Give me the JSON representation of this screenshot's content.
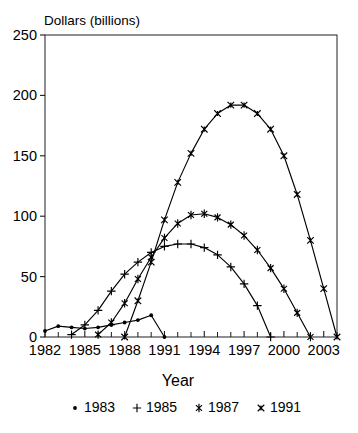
{
  "chart_data": {
    "type": "line",
    "title": "",
    "xlabel": "Year",
    "ylabel": "Dollars (billions)",
    "xlim": [
      1982,
      2004
    ],
    "ylim": [
      0,
      250
    ],
    "yticks": [
      0,
      50,
      100,
      150,
      200,
      250
    ],
    "ytick_labels": [
      "0",
      "50",
      "100",
      "150",
      "200",
      "250"
    ],
    "xticks": [
      1982,
      1985,
      1988,
      1991,
      1994,
      1997,
      2000,
      2003
    ],
    "xtick_labels": [
      "1982",
      "1985",
      "1988",
      "1991",
      "1994",
      "1997",
      "2000",
      "2003"
    ],
    "x_minor_tick_interval": 1,
    "grid": "horizontal-dotted",
    "legend_position": "below",
    "series": [
      {
        "name": "1983",
        "marker": "dot",
        "x": [
          1982,
          1983,
          1984,
          1985,
          1986,
          1987,
          1988,
          1989,
          1990,
          1991
        ],
        "values": [
          5,
          9,
          8,
          7,
          8,
          10,
          12,
          14,
          18,
          0
        ]
      },
      {
        "name": "1985",
        "marker": "plus",
        "x": [
          1984,
          1985,
          1986,
          1987,
          1988,
          1989,
          1990,
          1991,
          1992,
          1993,
          1994,
          1995,
          1996,
          1997,
          1998,
          1999
        ],
        "values": [
          2,
          10,
          22,
          38,
          52,
          62,
          70,
          75,
          77,
          77,
          74,
          68,
          58,
          44,
          26,
          0
        ]
      },
      {
        "name": "1987",
        "marker": "asterisk",
        "x": [
          1986,
          1987,
          1988,
          1989,
          1990,
          1991,
          1992,
          1993,
          1994,
          1995,
          1996,
          1997,
          1998,
          1999,
          2000,
          2001,
          2002
        ],
        "values": [
          2,
          12,
          28,
          48,
          66,
          82,
          94,
          101,
          102,
          99,
          93,
          84,
          72,
          57,
          40,
          20,
          0
        ]
      },
      {
        "name": "1991",
        "marker": "star-x",
        "x": [
          1988,
          1989,
          1990,
          1991,
          1992,
          1993,
          1994,
          1995,
          1996,
          1997,
          1998,
          1999,
          2000,
          2001,
          2002,
          2003,
          2004
        ],
        "values": [
          0,
          30,
          62,
          97,
          128,
          152,
          172,
          185,
          192,
          192,
          185,
          172,
          150,
          118,
          80,
          40,
          0
        ]
      }
    ],
    "legend": [
      {
        "label": "1983",
        "marker": "dot"
      },
      {
        "label": "1985",
        "marker": "plus"
      },
      {
        "label": "1987",
        "marker": "asterisk"
      },
      {
        "label": "1991",
        "marker": "star-x"
      }
    ]
  }
}
